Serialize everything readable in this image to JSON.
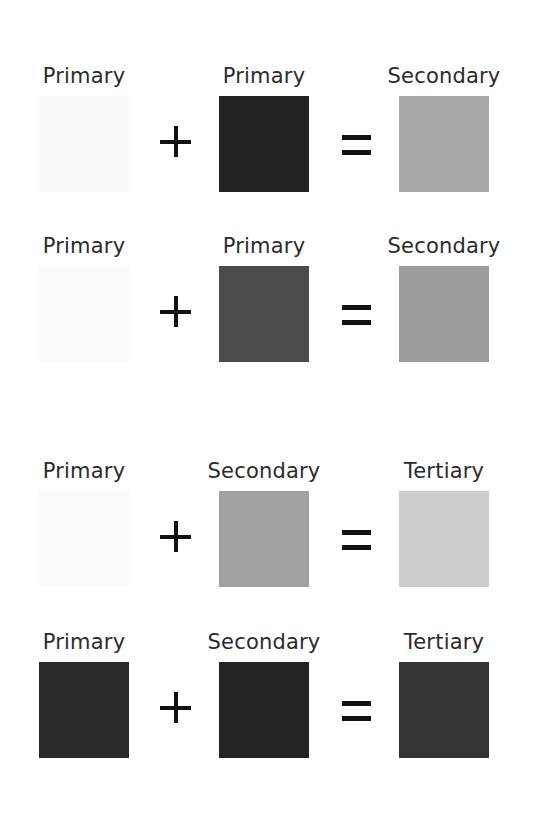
{
  "rows": [
    {
      "operands": [
        {
          "label": "Primary",
          "color": "#f9f9f9"
        },
        {
          "label": "Primary",
          "color": "#222222"
        }
      ],
      "operator": "+",
      "equals": "=",
      "result": {
        "label": "Secondary",
        "color": "#a9a9a9"
      }
    },
    {
      "operands": [
        {
          "label": "Primary",
          "color": "#fafafa"
        },
        {
          "label": "Primary",
          "color": "#4b4b4b"
        }
      ],
      "operator": "+",
      "equals": "=",
      "result": {
        "label": "Secondary",
        "color": "#9c9c9c"
      }
    },
    {
      "operands": [
        {
          "label": "Primary",
          "color": "#fafafa"
        },
        {
          "label": "Secondary",
          "color": "#a0a0a0"
        }
      ],
      "operator": "+",
      "equals": "=",
      "result": {
        "label": "Tertiary",
        "color": "#cccccc"
      }
    },
    {
      "operands": [
        {
          "label": "Primary",
          "color": "#2a2a2a"
        },
        {
          "label": "Secondary",
          "color": "#242424"
        }
      ],
      "operator": "+",
      "equals": "=",
      "result": {
        "label": "Tertiary",
        "color": "#353535"
      }
    }
  ]
}
